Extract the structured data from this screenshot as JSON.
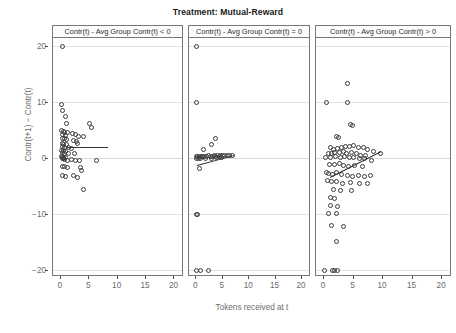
{
  "figure": {
    "title": "Treatment: Mutual-Reward",
    "xlabel": "Tokens received at t",
    "ylabel": "Contr(t+1) − Contr(t)"
  },
  "chart_data": {
    "type": "scatter",
    "title": "Treatment: Mutual-Reward",
    "xlabel": "Tokens received at t",
    "ylabel": "Contr(t+1) − Contr(t)",
    "grid": true,
    "legend": null,
    "xlim": [
      -1.2,
      21.5
    ],
    "ylim": [
      -21,
      21.5
    ],
    "xticks": [
      0,
      5,
      10,
      15,
      20
    ],
    "yticks": [
      -20,
      -10,
      0,
      10,
      20
    ],
    "panel_layout": "1x3 facets, shared y-axis",
    "panels": [
      {
        "label": "Contr(t) - Avg Group Contr(t) < 0",
        "fit": {
          "type": "linear",
          "x0": 1.0,
          "y0": 2.0,
          "x1": 8.4,
          "y1": 2.0,
          "slope": 0.0,
          "intercept": 2.0
        },
        "points": [
          [
            0.5,
            20.0
          ],
          [
            0.3,
            9.6
          ],
          [
            0.5,
            8.6
          ],
          [
            1.0,
            7.4
          ],
          [
            1.1,
            6.2
          ],
          [
            5.2,
            6.3
          ],
          [
            5.6,
            5.6
          ],
          [
            0.3,
            4.9
          ],
          [
            0.6,
            4.8
          ],
          [
            0.9,
            4.7
          ],
          [
            1.3,
            4.6
          ],
          [
            0.4,
            4.2
          ],
          [
            1.0,
            4.1
          ],
          [
            2.2,
            4.5
          ],
          [
            2.7,
            4.3
          ],
          [
            3.3,
            4.0
          ],
          [
            4.1,
            3.9
          ],
          [
            0.5,
            3.6
          ],
          [
            0.8,
            3.5
          ],
          [
            1.2,
            3.4
          ],
          [
            2.4,
            3.2
          ],
          [
            3.0,
            3.0
          ],
          [
            3.1,
            2.6
          ],
          [
            0.4,
            2.6
          ],
          [
            0.7,
            2.5
          ],
          [
            1.1,
            2.4
          ],
          [
            0.5,
            2.1
          ],
          [
            0.9,
            2.0
          ],
          [
            1.6,
            1.9
          ],
          [
            2.0,
            1.8
          ],
          [
            0.3,
            1.5
          ],
          [
            0.6,
            1.4
          ],
          [
            1.0,
            1.3
          ],
          [
            0.4,
            1.0
          ],
          [
            0.8,
            0.9
          ],
          [
            1.5,
            0.8
          ],
          [
            2.6,
            0.9
          ],
          [
            0.3,
            0.4
          ],
          [
            0.5,
            0.3
          ],
          [
            0.7,
            0.2
          ],
          [
            1.0,
            0.1
          ],
          [
            0.4,
            0.0
          ],
          [
            0.6,
            -0.1
          ],
          [
            0.9,
            -0.2
          ],
          [
            1.3,
            -0.3
          ],
          [
            2.1,
            -0.2
          ],
          [
            2.8,
            -0.3
          ],
          [
            3.4,
            -0.4
          ],
          [
            6.4,
            -0.3
          ],
          [
            0.4,
            -1.4
          ],
          [
            0.9,
            -1.5
          ],
          [
            1.4,
            -1.6
          ],
          [
            3.6,
            -1.7
          ],
          [
            3.9,
            -2.1
          ],
          [
            0.5,
            -3.1
          ],
          [
            1.0,
            -3.2
          ],
          [
            2.4,
            -3.0
          ],
          [
            3.1,
            -3.4
          ],
          [
            4.2,
            -5.6
          ]
        ]
      },
      {
        "label": "Contr(t) - Avg Group Contr(t) = 0",
        "fit": {
          "type": "linear",
          "x0": 0.3,
          "y0": -1.2,
          "x1": 7.4,
          "y1": 0.6,
          "slope": 0.25,
          "intercept": -1.28
        },
        "points": [
          [
            0.2,
            20.0
          ],
          [
            0.2,
            10.0
          ],
          [
            3.9,
            3.6
          ],
          [
            3.0,
            2.4
          ],
          [
            1.5,
            1.6
          ],
          [
            0.2,
            0.4
          ],
          [
            0.5,
            0.4
          ],
          [
            0.8,
            0.3
          ],
          [
            1.1,
            0.3
          ],
          [
            1.4,
            0.4
          ],
          [
            1.8,
            0.3
          ],
          [
            2.2,
            0.4
          ],
          [
            2.5,
            0.5
          ],
          [
            2.9,
            0.4
          ],
          [
            3.3,
            0.4
          ],
          [
            3.6,
            0.5
          ],
          [
            3.9,
            0.4
          ],
          [
            4.2,
            0.5
          ],
          [
            4.5,
            0.4
          ],
          [
            4.8,
            0.5
          ],
          [
            5.2,
            0.5
          ],
          [
            5.6,
            0.6
          ],
          [
            6.0,
            0.5
          ],
          [
            6.5,
            0.6
          ],
          [
            7.0,
            0.5
          ],
          [
            0.3,
            0.0
          ],
          [
            0.6,
            0.0
          ],
          [
            1.0,
            0.0
          ],
          [
            2.0,
            0.0
          ],
          [
            3.1,
            0.0
          ],
          [
            4.0,
            0.1
          ],
          [
            5.0,
            0.1
          ],
          [
            0.7,
            -1.8
          ],
          [
            0.2,
            -10.0
          ],
          [
            0.4,
            -10.0
          ],
          [
            0.2,
            -20.0
          ],
          [
            1.0,
            -20.0
          ],
          [
            2.5,
            -20.0
          ]
        ]
      },
      {
        "label": "Contr(t) - Avg Group Contr(t) > 0",
        "fit": {
          "type": "linear",
          "x0": 1.2,
          "y0": -3.4,
          "x1": 9.8,
          "y1": 1.2,
          "slope": 0.535,
          "intercept": -4.04
        },
        "points": [
          [
            4.2,
            13.4
          ],
          [
            0.5,
            10.0
          ],
          [
            4.2,
            9.9
          ],
          [
            4.6,
            6.0
          ],
          [
            5.0,
            5.8
          ],
          [
            2.2,
            4.0
          ],
          [
            2.6,
            3.7
          ],
          [
            1.2,
            1.9
          ],
          [
            1.8,
            1.6
          ],
          [
            2.4,
            1.8
          ],
          [
            3.1,
            2.0
          ],
          [
            3.8,
            2.2
          ],
          [
            4.5,
            2.1
          ],
          [
            5.2,
            2.3
          ],
          [
            6.0,
            2.0
          ],
          [
            6.8,
            1.9
          ],
          [
            7.5,
            1.6
          ],
          [
            8.6,
            1.2
          ],
          [
            1.0,
            0.9
          ],
          [
            1.5,
            0.8
          ],
          [
            2.0,
            1.0
          ],
          [
            2.8,
            1.1
          ],
          [
            3.4,
            1.2
          ],
          [
            4.0,
            0.9
          ],
          [
            4.8,
            1.0
          ],
          [
            5.6,
            0.8
          ],
          [
            6.4,
            0.6
          ],
          [
            7.2,
            0.5
          ],
          [
            9.7,
            0.9
          ],
          [
            0.4,
            0.2
          ],
          [
            1.3,
            0.1
          ],
          [
            2.1,
            0.3
          ],
          [
            3.0,
            0.2
          ],
          [
            3.7,
            0.3
          ],
          [
            4.4,
            0.2
          ],
          [
            5.1,
            0.1
          ],
          [
            6.1,
            0.0
          ],
          [
            7.0,
            -0.1
          ],
          [
            8.2,
            -0.3
          ],
          [
            1.1,
            -1.0
          ],
          [
            1.9,
            -1.1
          ],
          [
            2.7,
            -0.9
          ],
          [
            3.5,
            -1.2
          ],
          [
            4.3,
            -1.4
          ],
          [
            5.4,
            -1.3
          ],
          [
            6.6,
            -1.5
          ],
          [
            0.5,
            -2.6
          ],
          [
            1.0,
            -2.7
          ],
          [
            1.6,
            -2.8
          ],
          [
            2.3,
            -2.6
          ],
          [
            3.2,
            -2.9
          ],
          [
            4.1,
            -3.0
          ],
          [
            5.0,
            -3.2
          ],
          [
            6.0,
            -3.1
          ],
          [
            7.1,
            -3.3
          ],
          [
            8.0,
            -3.0
          ],
          [
            0.7,
            -4.0
          ],
          [
            1.4,
            -4.2
          ],
          [
            2.2,
            -4.1
          ],
          [
            3.3,
            -4.4
          ],
          [
            4.6,
            -4.3
          ],
          [
            6.2,
            -4.5
          ],
          [
            7.6,
            -4.4
          ],
          [
            1.8,
            -5.6
          ],
          [
            3.0,
            -5.8
          ],
          [
            4.8,
            -5.7
          ],
          [
            1.3,
            -7.0
          ],
          [
            2.0,
            -7.2
          ],
          [
            1.2,
            -8.4
          ],
          [
            2.5,
            -8.6
          ],
          [
            0.9,
            -9.8
          ],
          [
            2.2,
            -9.9
          ],
          [
            1.5,
            -12.0
          ],
          [
            3.4,
            -12.2
          ],
          [
            2.3,
            -14.8
          ],
          [
            0.3,
            -20.0
          ],
          [
            1.6,
            -20.0
          ],
          [
            2.0,
            -20.0
          ],
          [
            2.4,
            -20.0
          ]
        ]
      }
    ]
  }
}
